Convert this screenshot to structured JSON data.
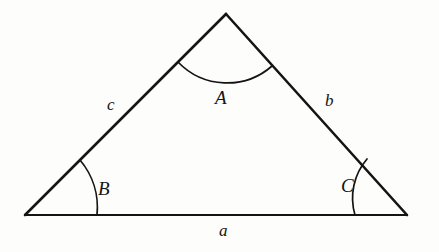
{
  "figure": {
    "type": "geometry-diagram",
    "background_color": "#fdfdfc",
    "ink_color": "#141414",
    "vertices": [
      {
        "name": "apex-vertex",
        "angle_label": "A",
        "x": 226,
        "y": 14
      },
      {
        "name": "bottom-left-vertex",
        "angle_label": "B",
        "x": 25,
        "y": 215
      },
      {
        "name": "bottom-right-vertex",
        "angle_label": "C",
        "x": 407,
        "y": 215
      }
    ],
    "angles": [
      {
        "label": "A",
        "at_vertex": "apex-vertex",
        "arc_start_x": 178,
        "arc_start_y": 62,
        "arc_end_x": 272,
        "arc_end_y": 66,
        "arc_radius": 68,
        "arc_sweep": 1,
        "label_x": 222,
        "label_y": 99
      },
      {
        "label": "B",
        "at_vertex": "bottom-left-vertex",
        "arc_start_x": 80,
        "arc_start_y": 160,
        "arc_end_x": 97,
        "arc_end_y": 215,
        "arc_radius": 74,
        "arc_sweep": 1,
        "label_x": 105,
        "label_y": 190
      },
      {
        "label": "C",
        "at_vertex": "bottom-right-vertex",
        "arc_start_x": 367,
        "arc_start_y": 159,
        "arc_end_x": 355,
        "arc_end_y": 215,
        "arc_radius": 60,
        "arc_sweep": 0,
        "label_x": 347,
        "label_y": 187
      }
    ],
    "sides": [
      {
        "label": "a",
        "name": "side-a-base",
        "from": "bottom-left-vertex",
        "to": "bottom-right-vertex",
        "x1": 25,
        "y1": 215,
        "x2": 407,
        "y2": 215,
        "label_x": 224,
        "label_y": 233
      },
      {
        "label": "b",
        "name": "side-b-right",
        "from": "apex-vertex",
        "to": "bottom-right-vertex",
        "x1": 226,
        "y1": 14,
        "x2": 407,
        "y2": 215,
        "label_x": 331,
        "label_y": 102
      },
      {
        "label": "c",
        "name": "side-c-left",
        "from": "bottom-left-vertex",
        "to": "apex-vertex",
        "x1": 25,
        "y1": 215,
        "x2": 226,
        "y2": 14,
        "label_x": 113,
        "label_y": 106
      }
    ]
  }
}
